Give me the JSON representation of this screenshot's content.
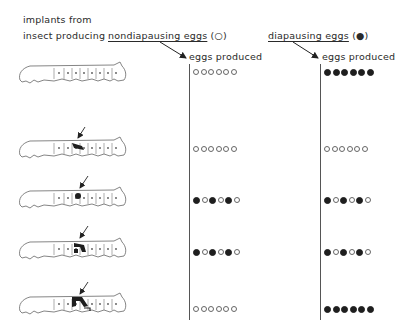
{
  "header": {
    "line1": "implants from",
    "line2_prefix": "insect producing",
    "left_group": {
      "label": "nondiapausing eggs",
      "symbol": "(○)"
    },
    "right_group": {
      "label": "diapausing eggs",
      "symbol": "(●)"
    }
  },
  "columns": [
    {
      "title": "eggs produced",
      "source": "nondiapausing eggs"
    },
    {
      "title": "eggs produced",
      "source": "diapausing eggs"
    }
  ],
  "legend": {
    "open_circle": "nondiapausing egg",
    "filled_circle": "diapausing egg"
  },
  "rows": [
    {
      "implant": "none",
      "left_eggs": "oooooo",
      "right_eggs": "xxxxxx"
    },
    {
      "implant": "brain/suboesophageal",
      "left_eggs": "oooooo",
      "right_eggs": "oooooo"
    },
    {
      "implant": "small dark organ",
      "left_eggs": "xoxoxo",
      "right_eggs": "xoxoxo"
    },
    {
      "implant": "medium dark organ",
      "left_eggs": "xoxoxo",
      "right_eggs": "xoxoxo"
    },
    {
      "implant": "large dark organ",
      "left_eggs": "oooooo",
      "right_eggs": "xxxxxx"
    }
  ],
  "colors": {
    "ink": "#2a2a2a",
    "fill": "#1e1e1e",
    "background": "#ffffff"
  }
}
